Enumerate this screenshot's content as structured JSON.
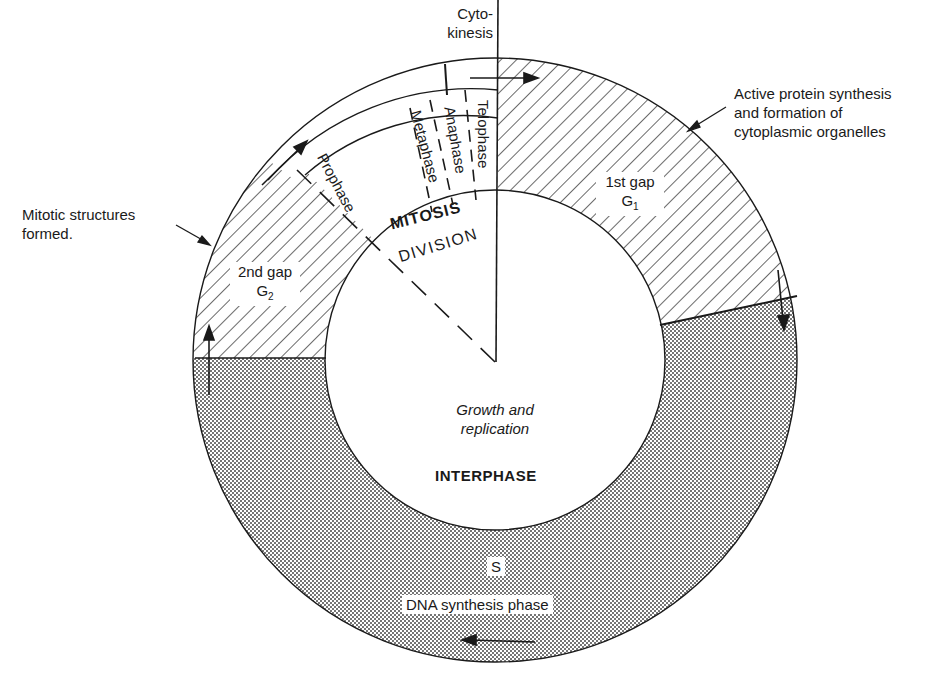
{
  "diagram": {
    "center_labels": {
      "growth_line1": "Growth and",
      "growth_line2": "replication",
      "interphase": "INTERPHASE",
      "mitosis": "MITOSIS",
      "division": "DIVISION"
    },
    "phases": {
      "prophase": "Prophase",
      "metaphase": "Metaphase",
      "anaphase": "Anaphase",
      "telophase": "Telophase",
      "cytokinesis_line1": "Cyto-",
      "cytokinesis_line2": "kinesis"
    },
    "gaps": {
      "g1_line1": "1st gap",
      "g1_symbol": "G",
      "g1_sub": "1",
      "g2_line1": "2nd gap",
      "g2_symbol": "G",
      "g2_sub": "2",
      "s_symbol": "S",
      "s_label": "DNA synthesis phase"
    },
    "annotations": {
      "g1_note_line1": "Active protein synthesis",
      "g1_note_line2": "and formation of",
      "g1_note_line3": "cytoplasmic organelles",
      "g2_note_line1": "Mitotic structures",
      "g2_note_line2": "formed."
    },
    "colors": {
      "ink": "#1a1a1a",
      "background": "#ffffff",
      "stipple": "#3a3a3a"
    }
  }
}
